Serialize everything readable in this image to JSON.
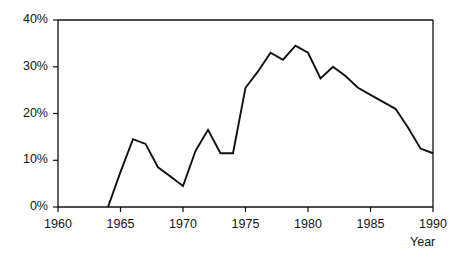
{
  "chart_data": {
    "type": "line",
    "title": "",
    "subtitle": "",
    "xlabel": "Year",
    "ylabel": "",
    "xlim": [
      1960,
      1990
    ],
    "ylim": [
      0,
      40
    ],
    "grid": false,
    "legend": "none",
    "x_tick_labels": [
      "1960",
      "1965",
      "1970",
      "1975",
      "1980",
      "1985",
      "1990"
    ],
    "x_ticks": [
      1960,
      1965,
      1970,
      1975,
      1980,
      1985,
      1990
    ],
    "y_tick_labels": [
      "0%",
      "10%",
      "20%",
      "30%",
      "40%"
    ],
    "y_ticks": [
      0,
      10,
      20,
      30,
      40
    ],
    "x": [
      1964,
      1965,
      1966,
      1967,
      1968,
      1969,
      1970,
      1971,
      1972,
      1973,
      1974,
      1975,
      1976,
      1977,
      1978,
      1979,
      1980,
      1981,
      1982,
      1983,
      1984,
      1985,
      1986,
      1987,
      1988,
      1989,
      1990
    ],
    "values": [
      0,
      7.5,
      14.5,
      13.5,
      8.5,
      6.5,
      4.5,
      12,
      16.5,
      11.5,
      11.5,
      25.5,
      29,
      33,
      31.5,
      34.5,
      33,
      27.5,
      30,
      28,
      25.5,
      24,
      22.5,
      21,
      17,
      12.5,
      11.5
    ],
    "series": [
      {
        "name": "percentage",
        "color": "#101010",
        "values": [
          0,
          7.5,
          14.5,
          13.5,
          8.5,
          6.5,
          4.5,
          12,
          16.5,
          11.5,
          11.5,
          25.5,
          29,
          33,
          31.5,
          34.5,
          33,
          27.5,
          30,
          28,
          25.5,
          24,
          22.5,
          21,
          17,
          12.5,
          11.5
        ]
      }
    ],
    "line_width": 1.9,
    "axis_color": "#101010"
  },
  "axes": {
    "x_title": "Year",
    "y_tick_0": "0%",
    "y_tick_10": "10%",
    "y_tick_20": "20%",
    "y_tick_30": "30%",
    "y_tick_40": "40%",
    "x_tick_1960": "1960",
    "x_tick_1965": "1965",
    "x_tick_1970": "1970",
    "x_tick_1975": "1975",
    "x_tick_1980": "1980",
    "x_tick_1985": "1985",
    "x_tick_1990": "1990"
  }
}
